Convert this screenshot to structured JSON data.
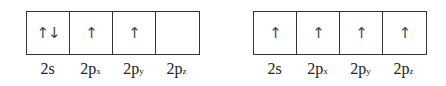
{
  "diagrams": [
    {
      "name": "ground-state",
      "orbitals": [
        {
          "label": "2s",
          "main": "2s",
          "sub": "",
          "electrons": "↑↓"
        },
        {
          "label": "2px",
          "main": "2p",
          "sub": "x",
          "electrons": "↑"
        },
        {
          "label": "2py",
          "main": "2p",
          "sub": "y",
          "electrons": "↑"
        },
        {
          "label": "2pz",
          "main": "2p",
          "sub": "z",
          "electrons": ""
        }
      ]
    },
    {
      "name": "excited-state",
      "orbitals": [
        {
          "label": "2s",
          "main": "2s",
          "sub": "",
          "electrons": "↑"
        },
        {
          "label": "2px",
          "main": "2p",
          "sub": "x",
          "electrons": "↑"
        },
        {
          "label": "2py",
          "main": "2p",
          "sub": "y",
          "electrons": "↑"
        },
        {
          "label": "2pz",
          "main": "2p",
          "sub": "z",
          "electrons": "↑"
        }
      ]
    }
  ]
}
